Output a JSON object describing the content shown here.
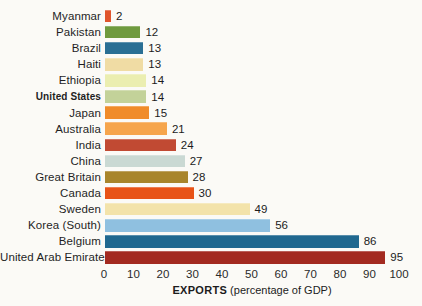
{
  "chart_data": {
    "type": "bar",
    "orientation": "horizontal",
    "title": "",
    "xlabel_bold": "EXPORTS",
    "xlabel_rest": " (percentage of GDP)",
    "xlim": [
      0,
      100
    ],
    "xticks": [
      0,
      10,
      20,
      30,
      40,
      50,
      60,
      70,
      80,
      90,
      100
    ],
    "grid": false,
    "legend": false,
    "categories": [
      "Myanmar",
      "Pakistan",
      "Brazil",
      "Haiti",
      "Ethiopia",
      "United States",
      "Japan",
      "Australia",
      "India",
      "China",
      "Great Britain",
      "Canada",
      "Sweden",
      "Korea (South)",
      "Belgium",
      "United Arab Emirates"
    ],
    "values": [
      2,
      12,
      13,
      13,
      14,
      14,
      15,
      21,
      24,
      27,
      28,
      30,
      49,
      56,
      86,
      95
    ],
    "bar_colors": [
      "#e0552c",
      "#6f9a3e",
      "#2a6f94",
      "#f0dca4",
      "#ebeeb0",
      "#c3d299",
      "#f08c2a",
      "#f6a54c",
      "#c14a33",
      "#cad9d3",
      "#a8852b",
      "#e85317",
      "#f3e3aa",
      "#8fc0e0",
      "#20688f",
      "#a32a20"
    ],
    "emphasized_category": "United States",
    "text_color": "#1f1f1f"
  }
}
